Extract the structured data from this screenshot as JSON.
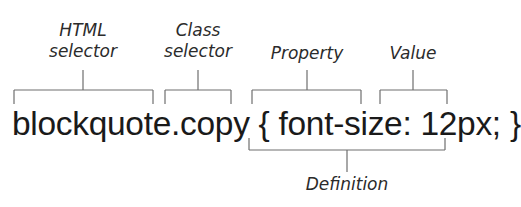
{
  "diagram": {
    "code": "blockquote.copy { font-size: 12px; }",
    "labels": {
      "html_selector_line1": "HTML",
      "html_selector_line2": "selector",
      "class_selector_line1": "Class",
      "class_selector_line2": "selector",
      "property": "Property",
      "value": "Value",
      "definition": "Definition"
    },
    "annotations": [
      {
        "label": "HTML selector",
        "targets": "blockquote"
      },
      {
        "label": "Class selector",
        "targets": ".copy"
      },
      {
        "label": "Property",
        "targets": "font-size:"
      },
      {
        "label": "Value",
        "targets": "12px;"
      },
      {
        "label": "Definition",
        "targets": "font-size: 12px;"
      }
    ],
    "colors": {
      "text": "#1a1a1a",
      "label": "#2b2b2b",
      "bracket": "#6e6e6e",
      "background": "#ffffff"
    }
  }
}
